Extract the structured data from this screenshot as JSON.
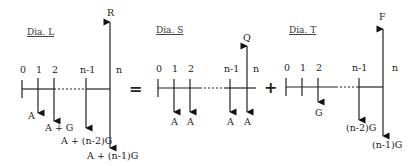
{
  "diagrams": [
    {
      "title": "Dia. L",
      "ticks": [
        "0",
        "1",
        "2",
        "n-1",
        "n"
      ],
      "up_label": "R",
      "down_labels": [
        "A",
        "A + G",
        "A + (n-2)G",
        "A + (n-1)G"
      ]
    },
    {
      "title": "Dia. S",
      "ticks": [
        "0",
        "1",
        "2",
        "n-1",
        "n"
      ],
      "up_label": "Q",
      "down_labels": [
        "A",
        "A",
        "A",
        "A"
      ]
    },
    {
      "title": "Dia. T",
      "ticks": [
        "0",
        "1",
        "2",
        "n-1",
        "n"
      ],
      "up_label": "F",
      "down_labels": [
        "G",
        "(n-2)G",
        "(n-1)G"
      ]
    }
  ],
  "operators": [
    "=",
    "+"
  ]
}
